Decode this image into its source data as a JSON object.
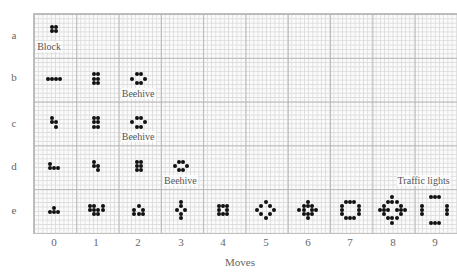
{
  "figure": {
    "x_axis_title": "Moves",
    "row_labels": [
      "a",
      "b",
      "c",
      "d",
      "e"
    ],
    "col_labels": [
      "0",
      "1",
      "2",
      "3",
      "4",
      "5",
      "6",
      "7",
      "8",
      "9"
    ],
    "cell_size": 4.2,
    "dot_color": "#111111",
    "grid_color_major": "#b8b8b8",
    "grid_color_minor": "#dcdcdc"
  },
  "captions": [
    {
      "text": "Block",
      "row": 0,
      "col": 0
    },
    {
      "text": "Beehive",
      "row": 1,
      "col": 2
    },
    {
      "text": "Beehive",
      "row": 2,
      "col": 2
    },
    {
      "text": "Beehive",
      "row": 3,
      "col": 3
    },
    {
      "text": "Traffic lights",
      "row": 3,
      "col": 8.9
    }
  ],
  "patterns": [
    {
      "row": 0,
      "col": 0,
      "cells": [
        [
          0,
          0
        ],
        [
          1,
          0
        ],
        [
          0,
          1
        ],
        [
          1,
          1
        ]
      ]
    },
    {
      "row": 1,
      "col": 0,
      "cells": [
        [
          0,
          0
        ],
        [
          1,
          0
        ],
        [
          2,
          0
        ],
        [
          3,
          0
        ]
      ]
    },
    {
      "row": 1,
      "col": 1,
      "cells": [
        [
          0,
          0
        ],
        [
          1,
          0
        ],
        [
          0,
          1
        ],
        [
          1,
          1
        ],
        [
          0,
          2
        ],
        [
          1,
          2
        ]
      ]
    },
    {
      "row": 1,
      "col": 2,
      "cells": [
        [
          1,
          0
        ],
        [
          2,
          0
        ],
        [
          0,
          1
        ],
        [
          3,
          1
        ],
        [
          1,
          2
        ],
        [
          2,
          2
        ]
      ]
    },
    {
      "row": 2,
      "col": 0,
      "cells": [
        [
          0,
          0
        ],
        [
          0,
          1
        ],
        [
          1,
          1
        ],
        [
          1,
          2
        ]
      ]
    },
    {
      "row": 2,
      "col": 1,
      "cells": [
        [
          0,
          0
        ],
        [
          1,
          0
        ],
        [
          0,
          1
        ],
        [
          1,
          1
        ],
        [
          0,
          2
        ],
        [
          1,
          2
        ]
      ]
    },
    {
      "row": 2,
      "col": 2,
      "cells": [
        [
          1,
          0
        ],
        [
          2,
          0
        ],
        [
          0,
          1
        ],
        [
          3,
          1
        ],
        [
          1,
          2
        ],
        [
          2,
          2
        ]
      ]
    },
    {
      "row": 3,
      "col": 0,
      "cells": [
        [
          0,
          0
        ],
        [
          0,
          1
        ],
        [
          1,
          1
        ],
        [
          2,
          1
        ]
      ]
    },
    {
      "row": 3,
      "col": 1,
      "cells": [
        [
          0,
          0
        ],
        [
          0,
          1
        ],
        [
          1,
          1
        ],
        [
          1,
          2
        ]
      ]
    },
    {
      "row": 3,
      "col": 2,
      "cells": [
        [
          0,
          0
        ],
        [
          1,
          0
        ],
        [
          0,
          1
        ],
        [
          1,
          1
        ],
        [
          0,
          2
        ],
        [
          1,
          2
        ]
      ]
    },
    {
      "row": 3,
      "col": 3,
      "cells": [
        [
          1,
          0
        ],
        [
          2,
          0
        ],
        [
          0,
          1
        ],
        [
          3,
          1
        ],
        [
          1,
          2
        ],
        [
          2,
          2
        ]
      ]
    },
    {
      "row": 4,
      "col": 0,
      "cells": [
        [
          1,
          0
        ],
        [
          0,
          1
        ],
        [
          1,
          1
        ],
        [
          2,
          1
        ]
      ]
    },
    {
      "row": 4,
      "col": 1,
      "cells": [
        [
          0,
          0
        ],
        [
          1,
          0
        ],
        [
          3,
          0
        ],
        [
          0,
          1
        ],
        [
          1,
          1
        ],
        [
          2,
          1
        ],
        [
          3,
          1
        ],
        [
          1,
          2
        ],
        [
          2,
          2
        ]
      ]
    },
    {
      "row": 4,
      "col": 2,
      "cells": [
        [
          1,
          0
        ],
        [
          0,
          1
        ],
        [
          2,
          1
        ],
        [
          0,
          2
        ],
        [
          1,
          2
        ],
        [
          2,
          2
        ]
      ]
    },
    {
      "row": 4,
      "col": 3,
      "cells": [
        [
          1,
          0
        ],
        [
          1,
          1
        ],
        [
          0,
          2
        ],
        [
          2,
          2
        ],
        [
          1,
          3
        ],
        [
          1,
          4
        ]
      ]
    },
    {
      "row": 4,
      "col": 4,
      "cells": [
        [
          0,
          0
        ],
        [
          2,
          0
        ],
        [
          0,
          1
        ],
        [
          2,
          1
        ],
        [
          0,
          2
        ],
        [
          1,
          0
        ],
        [
          1,
          2
        ],
        [
          2,
          2
        ]
      ]
    },
    {
      "row": 4,
      "col": 5,
      "cells": [
        [
          2,
          0
        ],
        [
          1,
          1
        ],
        [
          3,
          1
        ],
        [
          0,
          2
        ],
        [
          4,
          2
        ],
        [
          1,
          3
        ],
        [
          3,
          3
        ],
        [
          2,
          4
        ]
      ]
    },
    {
      "row": 4,
      "col": 6,
      "cells": [
        [
          2,
          0
        ],
        [
          1,
          1
        ],
        [
          2,
          1
        ],
        [
          3,
          1
        ],
        [
          0,
          2
        ],
        [
          1,
          2
        ],
        [
          3,
          2
        ],
        [
          4,
          2
        ],
        [
          1,
          3
        ],
        [
          2,
          3
        ],
        [
          3,
          3
        ],
        [
          2,
          4
        ]
      ]
    },
    {
      "row": 4,
      "col": 7,
      "cells": [
        [
          1,
          0
        ],
        [
          2,
          0
        ],
        [
          3,
          0
        ],
        [
          0,
          1
        ],
        [
          4,
          1
        ],
        [
          0,
          2
        ],
        [
          4,
          2
        ],
        [
          0,
          3
        ],
        [
          4,
          3
        ],
        [
          1,
          4
        ],
        [
          2,
          4
        ],
        [
          3,
          4
        ]
      ]
    },
    {
      "row": 4,
      "col": 8,
      "cells": [
        [
          3,
          0
        ],
        [
          2,
          1
        ],
        [
          3,
          1
        ],
        [
          4,
          1
        ],
        [
          1,
          2
        ],
        [
          5,
          2
        ],
        [
          0,
          3
        ],
        [
          1,
          3
        ],
        [
          2,
          3
        ],
        [
          4,
          3
        ],
        [
          5,
          3
        ],
        [
          6,
          3
        ],
        [
          1,
          4
        ],
        [
          5,
          4
        ],
        [
          2,
          5
        ],
        [
          3,
          5
        ],
        [
          4,
          5
        ],
        [
          3,
          6
        ]
      ]
    },
    {
      "row": 4,
      "col": 9,
      "cells": [
        [
          2,
          0
        ],
        [
          3,
          0
        ],
        [
          4,
          0
        ],
        [
          0,
          2
        ],
        [
          6,
          2
        ],
        [
          0,
          3
        ],
        [
          6,
          3
        ],
        [
          0,
          4
        ],
        [
          6,
          4
        ],
        [
          2,
          6
        ],
        [
          3,
          6
        ],
        [
          4,
          6
        ]
      ]
    }
  ]
}
